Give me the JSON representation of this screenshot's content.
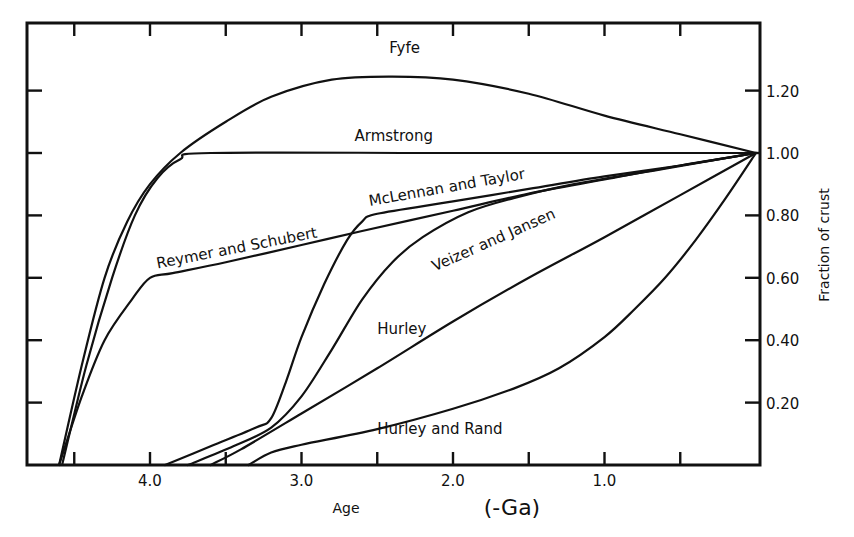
{
  "chart_data": {
    "type": "line",
    "title": "",
    "xlabel": "Age",
    "xunit": "(-Ga)",
    "ylabel": "Fraction of crust",
    "xlim": [
      4.8,
      0.0
    ],
    "ylim": [
      0.0,
      1.38
    ],
    "x_reversed": true,
    "grid": false,
    "legend": "inline labels on curves",
    "x_ticks": [
      4.5,
      4.0,
      3.5,
      3.0,
      2.5,
      2.0,
      1.5,
      1.0,
      0.5
    ],
    "x_tick_labels": [
      {
        "value": 4.0,
        "text": "4.0"
      },
      {
        "value": 3.0,
        "text": "3.0"
      },
      {
        "value": 2.0,
        "text": "2.0"
      },
      {
        "value": 1.0,
        "text": "1.0"
      }
    ],
    "y_ticks": [
      0.2,
      0.4,
      0.6,
      0.8,
      1.0,
      1.2
    ],
    "y_tick_labels": [
      {
        "value": 0.2,
        "text": "0.20"
      },
      {
        "value": 0.4,
        "text": "0.40"
      },
      {
        "value": 0.6,
        "text": "0.60"
      },
      {
        "value": 0.8,
        "text": "0.80"
      },
      {
        "value": 1.0,
        "text": "1.00"
      },
      {
        "value": 1.2,
        "text": "1.20"
      }
    ],
    "series": [
      {
        "name": "Fyfe",
        "points": [
          [
            4.6,
            0.0
          ],
          [
            4.45,
            0.32
          ],
          [
            4.3,
            0.6
          ],
          [
            4.15,
            0.78
          ],
          [
            4.0,
            0.9
          ],
          [
            3.8,
            1.0
          ],
          [
            3.5,
            1.1
          ],
          [
            3.2,
            1.18
          ],
          [
            2.8,
            1.235
          ],
          [
            2.4,
            1.245
          ],
          [
            2.0,
            1.235
          ],
          [
            1.5,
            1.19
          ],
          [
            1.0,
            1.12
          ],
          [
            0.5,
            1.06
          ],
          [
            0.0,
            1.0
          ]
        ],
        "label": {
          "text": "Fyfe",
          "age": 2.42,
          "frac": 1.32,
          "rotate": 0
        }
      },
      {
        "name": "Armstrong",
        "points": [
          [
            4.58,
            0.0
          ],
          [
            4.42,
            0.32
          ],
          [
            4.25,
            0.6
          ],
          [
            4.1,
            0.8
          ],
          [
            3.95,
            0.92
          ],
          [
            3.8,
            0.98
          ],
          [
            3.6,
            1.0
          ],
          [
            2.0,
            1.0
          ],
          [
            0.0,
            1.0
          ]
        ],
        "label": {
          "text": "Armstrong",
          "age": 2.65,
          "frac": 1.04,
          "rotate": 0
        }
      },
      {
        "name": "Reymer and Schubert",
        "points": [
          [
            4.6,
            0.0
          ],
          [
            4.45,
            0.22
          ],
          [
            4.3,
            0.4
          ],
          [
            4.12,
            0.53
          ],
          [
            4.0,
            0.6
          ],
          [
            3.85,
            0.615
          ],
          [
            3.5,
            0.65
          ],
          [
            3.0,
            0.705
          ],
          [
            2.6,
            0.75
          ],
          [
            2.0,
            0.815
          ],
          [
            1.5,
            0.87
          ],
          [
            1.0,
            0.915
          ],
          [
            0.5,
            0.96
          ],
          [
            0.0,
            1.0
          ]
        ],
        "label": {
          "text": "Reymer and Schubert",
          "age": 3.95,
          "frac": 0.63,
          "rotate": -11
        }
      },
      {
        "name": "McLennan and Taylor",
        "points": [
          [
            3.9,
            0.0
          ],
          [
            3.6,
            0.06
          ],
          [
            3.3,
            0.12
          ],
          [
            3.2,
            0.15
          ],
          [
            3.1,
            0.27
          ],
          [
            3.0,
            0.41
          ],
          [
            2.85,
            0.58
          ],
          [
            2.7,
            0.72
          ],
          [
            2.6,
            0.78
          ],
          [
            2.5,
            0.805
          ],
          [
            2.0,
            0.845
          ],
          [
            1.5,
            0.885
          ],
          [
            1.0,
            0.925
          ],
          [
            0.5,
            0.96
          ],
          [
            0.0,
            1.0
          ]
        ],
        "label": {
          "text": "McLennan and Taylor",
          "age": 2.55,
          "frac": 0.83,
          "rotate": -10
        }
      },
      {
        "name": "Veizer and Jansen",
        "points": [
          [
            3.75,
            0.0
          ],
          [
            3.45,
            0.06
          ],
          [
            3.2,
            0.12
          ],
          [
            3.0,
            0.22
          ],
          [
            2.8,
            0.37
          ],
          [
            2.6,
            0.53
          ],
          [
            2.4,
            0.65
          ],
          [
            2.2,
            0.73
          ],
          [
            1.9,
            0.81
          ],
          [
            1.6,
            0.855
          ],
          [
            1.2,
            0.9
          ],
          [
            0.6,
            0.95
          ],
          [
            0.0,
            1.0
          ]
        ],
        "label": {
          "text": "Veizer and Jansen",
          "age": 2.12,
          "frac": 0.62,
          "rotate": -24
        }
      },
      {
        "name": "Hurley",
        "points": [
          [
            3.6,
            0.0
          ],
          [
            3.4,
            0.05
          ],
          [
            3.0,
            0.165
          ],
          [
            2.5,
            0.31
          ],
          [
            2.0,
            0.46
          ],
          [
            1.5,
            0.6
          ],
          [
            1.0,
            0.73
          ],
          [
            0.5,
            0.865
          ],
          [
            0.0,
            1.0
          ]
        ],
        "label": {
          "text": "Hurley",
          "age": 2.5,
          "frac": 0.42,
          "rotate": 0
        }
      },
      {
        "name": "Hurley and Rand",
        "points": [
          [
            3.35,
            0.0
          ],
          [
            3.2,
            0.04
          ],
          [
            3.0,
            0.065
          ],
          [
            2.5,
            0.115
          ],
          [
            2.0,
            0.18
          ],
          [
            1.6,
            0.245
          ],
          [
            1.3,
            0.31
          ],
          [
            1.0,
            0.41
          ],
          [
            0.8,
            0.5
          ],
          [
            0.6,
            0.6
          ],
          [
            0.4,
            0.72
          ],
          [
            0.2,
            0.855
          ],
          [
            0.0,
            1.0
          ]
        ],
        "label": {
          "text": "Hurley and Rand",
          "age": 2.5,
          "frac": 0.1,
          "rotate": 0
        }
      }
    ]
  },
  "axes": {
    "x_title": "Age",
    "x_unit": "(-Ga)",
    "y_title": "Fraction of crust"
  }
}
